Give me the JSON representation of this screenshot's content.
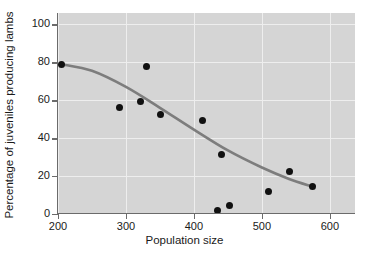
{
  "chart_data": {
    "type": "scatter",
    "title": "",
    "xlabel": "Population size",
    "ylabel": "Percentage of juveniles producing lambs",
    "xlim": [
      200,
      637
    ],
    "ylim": [
      0,
      106
    ],
    "xticks": [
      200,
      300,
      400,
      500,
      600
    ],
    "yticks": [
      0,
      20,
      40,
      60,
      80,
      100
    ],
    "xticklabels": [
      "200",
      "300",
      "400",
      "500",
      "600"
    ],
    "yticklabels": [
      "0",
      "20",
      "40",
      "60",
      "80",
      "100"
    ],
    "grid": true,
    "legend": null,
    "series": [
      {
        "name": "observations",
        "marker": "filled-circle",
        "color": "#111111",
        "points": [
          {
            "x": 205,
            "y": 79
          },
          {
            "x": 290,
            "y": 56
          },
          {
            "x": 322,
            "y": 59.5
          },
          {
            "x": 330,
            "y": 78
          },
          {
            "x": 351,
            "y": 52.5
          },
          {
            "x": 412,
            "y": 49.5
          },
          {
            "x": 435,
            "y": 2
          },
          {
            "x": 441,
            "y": 31.5
          },
          {
            "x": 452,
            "y": 4.5
          },
          {
            "x": 510,
            "y": 12
          },
          {
            "x": 540,
            "y": 22.5
          },
          {
            "x": 574,
            "y": 14.5
          }
        ]
      },
      {
        "name": "fitted-trend-curve",
        "marker": "none",
        "type": "line",
        "color": "#7d7d7d",
        "points": [
          {
            "x": 205,
            "y": 79
          },
          {
            "x": 250,
            "y": 75.5
          },
          {
            "x": 300,
            "y": 67
          },
          {
            "x": 350,
            "y": 56
          },
          {
            "x": 400,
            "y": 44.5
          },
          {
            "x": 450,
            "y": 33.5
          },
          {
            "x": 500,
            "y": 24.5
          },
          {
            "x": 540,
            "y": 18.5
          },
          {
            "x": 574,
            "y": 14.5
          }
        ]
      }
    ],
    "colors": {
      "panel_background": "#d5d5d5",
      "page_background": "#ffffff",
      "gridline": "#eeeeee",
      "axis": "#6b6b6b",
      "marker": "#111111",
      "trend_line": "#7d7d7d",
      "text": "#1a1a1a"
    }
  }
}
